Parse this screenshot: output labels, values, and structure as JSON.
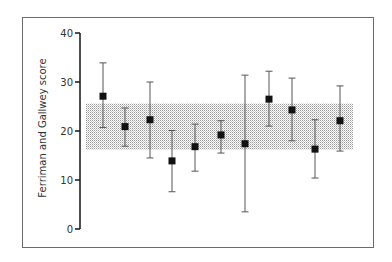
{
  "chart_data": {
    "type": "scatter",
    "subtype": "point-with-error-bars",
    "title": "",
    "xlabel": "",
    "ylabel": "Ferriman and Gallwey score",
    "ylim": [
      0,
      40
    ],
    "yticks": [
      0,
      10,
      20,
      30,
      40
    ],
    "xticks": [],
    "grid": false,
    "legend": null,
    "reference_band": {
      "lower": 16.2,
      "upper": 25.6,
      "style": "stippled gray"
    },
    "points": [
      {
        "x": 1,
        "value": 27.1,
        "lower": 20.7,
        "upper": 33.9
      },
      {
        "x": 2,
        "value": 20.9,
        "lower": 16.9,
        "upper": 24.7
      },
      {
        "x": 3,
        "value": 22.3,
        "lower": 14.5,
        "upper": 30.0
      },
      {
        "x": 4,
        "value": 13.9,
        "lower": 7.6,
        "upper": 20.1
      },
      {
        "x": 5,
        "value": 16.8,
        "lower": 11.8,
        "upper": 21.4
      },
      {
        "x": 6,
        "value": 19.2,
        "lower": 15.5,
        "upper": 22.1
      },
      {
        "x": 7,
        "value": 17.4,
        "lower": 3.5,
        "upper": 31.4
      },
      {
        "x": 8,
        "value": 26.5,
        "lower": 21.0,
        "upper": 32.2
      },
      {
        "x": 9,
        "value": 24.3,
        "lower": 18.0,
        "upper": 30.8
      },
      {
        "x": 10,
        "value": 16.3,
        "lower": 10.4,
        "upper": 22.3
      },
      {
        "x": 11,
        "value": 22.1,
        "lower": 15.9,
        "upper": 29.2
      }
    ]
  },
  "layout": {
    "colors": {
      "marker": "#111111",
      "error_bar": "#555555",
      "band": "#bdbdbd",
      "frame": "#6b6b6b",
      "axis": "#222222"
    }
  }
}
